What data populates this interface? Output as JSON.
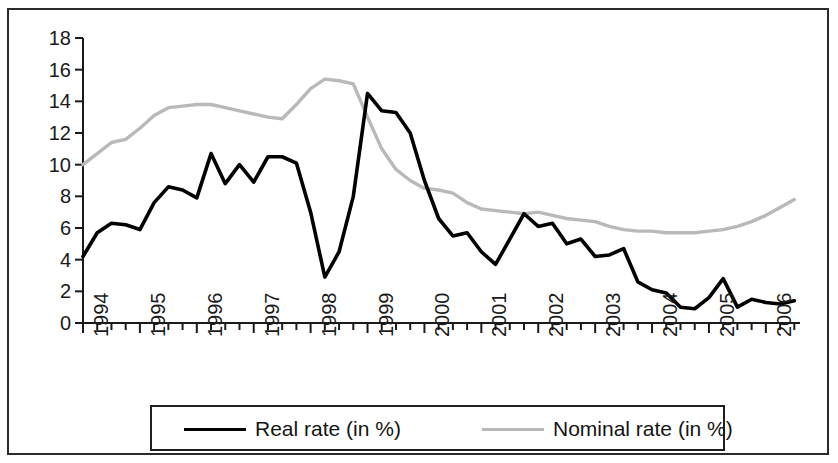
{
  "chart_data": {
    "type": "line",
    "title": "",
    "subtitle": "",
    "xlabel": "",
    "ylabel": "",
    "xlim": [
      1994.0,
      2006.6
    ],
    "ylim": [
      0,
      18
    ],
    "ytick_step": 2,
    "grid": false,
    "legend_position": "bottom",
    "x_tick_frequency": "quarterly",
    "x_tick_labels": [
      "1994",
      "1995",
      "1996",
      "1997",
      "1998",
      "1999",
      "2000",
      "2001",
      "2002",
      "2003",
      "2004",
      "2005",
      "2006"
    ],
    "y_tick_labels": [
      "0",
      "2",
      "4",
      "6",
      "8",
      "10",
      "12",
      "14",
      "16",
      "18"
    ],
    "x": [
      1994.0,
      1994.25,
      1994.5,
      1994.75,
      1995.0,
      1995.25,
      1995.5,
      1995.75,
      1996.0,
      1996.25,
      1996.5,
      1996.75,
      1997.0,
      1997.25,
      1997.5,
      1997.75,
      1998.0,
      1998.25,
      1998.5,
      1998.75,
      1999.0,
      1999.25,
      1999.5,
      1999.75,
      2000.0,
      2000.25,
      2000.5,
      2000.75,
      2001.0,
      2001.25,
      2001.5,
      2001.75,
      2002.0,
      2002.25,
      2002.5,
      2002.75,
      2003.0,
      2003.25,
      2003.5,
      2003.75,
      2004.0,
      2004.25,
      2004.5,
      2004.75,
      2005.0,
      2005.25,
      2005.5,
      2005.75,
      2006.0,
      2006.25,
      2006.5
    ],
    "series": [
      {
        "name": "Real rate (in %)",
        "color": "#000000",
        "values": [
          4.2,
          5.7,
          6.3,
          6.2,
          5.9,
          7.6,
          8.6,
          8.4,
          7.9,
          10.7,
          8.8,
          10.0,
          8.9,
          10.5,
          10.5,
          10.1,
          7.0,
          2.9,
          4.5,
          8.0,
          14.5,
          13.4,
          13.3,
          12.0,
          9.0,
          6.6,
          5.5,
          5.7,
          4.5,
          3.7,
          5.3,
          6.9,
          6.1,
          6.3,
          5.0,
          5.3,
          4.2,
          4.3,
          4.7,
          2.6,
          2.1,
          1.9,
          1.0,
          0.9,
          1.6,
          2.8,
          1.0,
          1.5,
          1.3,
          1.2,
          1.4
        ]
      },
      {
        "name": "Nominal rate (in %)",
        "color": "#b9b9b9",
        "values": [
          10.0,
          10.7,
          11.4,
          11.6,
          12.3,
          13.1,
          13.6,
          13.7,
          13.8,
          13.8,
          13.6,
          13.4,
          13.2,
          13.0,
          12.9,
          13.8,
          14.8,
          15.4,
          15.3,
          15.1,
          13.0,
          11.0,
          9.7,
          9.0,
          8.5,
          8.4,
          8.2,
          7.6,
          7.2,
          7.1,
          7.0,
          6.9,
          7.0,
          6.8,
          6.6,
          6.5,
          6.4,
          6.1,
          5.9,
          5.8,
          5.8,
          5.7,
          5.7,
          5.7,
          5.8,
          5.9,
          6.1,
          6.4,
          6.8,
          7.3,
          7.8
        ]
      }
    ]
  },
  "legend": {
    "entries": [
      {
        "label": "Real rate (in %)",
        "swatch": "solid-black-line"
      },
      {
        "label": "Nominal rate (in %)",
        "swatch": "solid-gray-line"
      }
    ]
  },
  "axes": {
    "y_ticks": [
      "18",
      "16",
      "14",
      "12",
      "10",
      "8",
      "6",
      "4",
      "2",
      "0"
    ],
    "x_ticks": [
      "1994",
      "1995",
      "1996",
      "1997",
      "1998",
      "1999",
      "2000",
      "2001",
      "2002",
      "2003",
      "2004",
      "2005",
      "2006"
    ]
  },
  "colors": {
    "real_line": "#000000",
    "nominal_line": "#b9b9b9",
    "axis": "#1a1a1a",
    "frame": "#2b2b2b",
    "background": "#ffffff"
  }
}
